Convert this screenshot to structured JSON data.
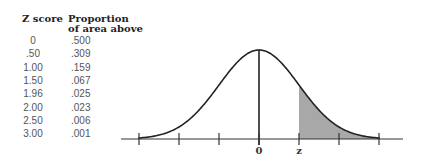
{
  "table": {
    "headers": {
      "z_score": "Z score",
      "proportion_line1": "Proportion",
      "proportion_line2": "of area above"
    },
    "rows": [
      {
        "z": "0",
        "p": ".500"
      },
      {
        "z": ".50",
        "p": ".309"
      },
      {
        "z": "1.00",
        "p": ".159"
      },
      {
        "z": "1.50",
        "p": ".067"
      },
      {
        "z": "1.96",
        "p": ".025"
      },
      {
        "z": "2.00",
        "p": ".023"
      },
      {
        "z": "2.50",
        "p": ".006"
      },
      {
        "z": "3.00",
        "p": ".001"
      }
    ]
  },
  "diagram": {
    "type": "normal-distribution",
    "axis_labels": {
      "center": "0",
      "z": "z"
    },
    "shaded_region": "area above z",
    "tick_count": 7,
    "colors": {
      "curve": "#222222",
      "shade": "#a8a8a8",
      "axis": "#333333"
    }
  }
}
